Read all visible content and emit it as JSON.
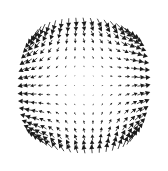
{
  "figure": {
    "title": "",
    "background_color": "#ffffff",
    "width": 168,
    "height": 171
  },
  "chart_data": {
    "type": "scatter",
    "plot_kind": "quiver",
    "title": "",
    "subtitle": "",
    "xlabel": "",
    "ylabel": "",
    "xlim": [
      -1,
      1
    ],
    "ylim": [
      -1,
      1
    ],
    "grid": false,
    "axes_visible": false,
    "tick_labels_x": [],
    "tick_labels_y": [],
    "legend": [],
    "annotations": [],
    "arrow_color": "#1a1a1a",
    "shaft_color": "#2b2b2b",
    "grid_rows": 17,
    "grid_cols": 17,
    "field_description": "radial outward displacement field with pincushion lattice warp and slight clockwise swirl; magnitude increases with distance from center, near zero at center",
    "field_model": {
      "center_x": 0.0,
      "center_y": 0.0,
      "radial_gain": 1.0,
      "swirl_gain": 0.22,
      "magnitude_exponent": 1.25,
      "max_arrow_length_px": 13.5,
      "lattice_pincushion_k": -0.17,
      "plot_margin_px": 9
    },
    "points": [
      {
        "x": -1.0,
        "y": 1.0,
        "u": -0.861,
        "v": 0.509
      },
      {
        "x": -0.875,
        "y": 1.0,
        "u": -0.772,
        "v": 0.636
      },
      {
        "x": -0.75,
        "y": 1.0,
        "u": -0.664,
        "v": 0.748
      },
      {
        "x": -0.625,
        "y": 1.0,
        "u": -0.54,
        "v": 0.841
      },
      {
        "x": -0.5,
        "y": 1.0,
        "u": -0.405,
        "v": 0.914
      },
      {
        "x": -0.375,
        "y": 1.0,
        "u": -0.262,
        "v": 0.965
      },
      {
        "x": -0.25,
        "y": 1.0,
        "u": -0.115,
        "v": 0.993
      },
      {
        "x": -0.125,
        "y": 1.0,
        "u": 0.034,
        "v": 0.999
      },
      {
        "x": 0.0,
        "y": 1.0,
        "u": 0.183,
        "v": 0.983
      },
      {
        "x": 0.125,
        "y": 1.0,
        "u": 0.329,
        "v": 0.944
      },
      {
        "x": 0.25,
        "y": 1.0,
        "u": 0.47,
        "v": 0.883
      },
      {
        "x": 0.375,
        "y": 1.0,
        "u": 0.603,
        "v": 0.798
      },
      {
        "x": 0.5,
        "y": 1.0,
        "u": 0.725,
        "v": 0.689
      },
      {
        "x": 0.625,
        "y": 1.0,
        "u": 0.833,
        "v": 0.553
      },
      {
        "x": 0.75,
        "y": 1.0,
        "u": 0.921,
        "v": 0.39
      },
      {
        "x": 0.875,
        "y": 1.0,
        "u": 0.982,
        "v": 0.2
      },
      {
        "x": 1.0,
        "y": 1.0,
        "u": 1.0,
        "v": 0.0
      },
      {
        "x": -1.0,
        "y": 0.75,
        "u": -0.946,
        "v": 0.324
      },
      {
        "x": -0.75,
        "y": 0.75,
        "u": -0.785,
        "v": 0.619
      },
      {
        "x": -0.5,
        "y": 0.75,
        "u": -0.556,
        "v": 0.831
      },
      {
        "x": -0.25,
        "y": 0.75,
        "u": -0.271,
        "v": 0.963
      },
      {
        "x": 0.0,
        "y": 0.75,
        "u": 0.043,
        "v": 0.999
      },
      {
        "x": 0.25,
        "y": 0.75,
        "u": 0.352,
        "v": 0.936
      },
      {
        "x": 0.5,
        "y": 0.75,
        "u": 0.624,
        "v": 0.781
      },
      {
        "x": 0.75,
        "y": 0.75,
        "u": 0.833,
        "v": 0.553
      },
      {
        "x": 1.0,
        "y": 0.75,
        "u": 0.964,
        "v": 0.266
      },
      {
        "x": -1.0,
        "y": 0.5,
        "u": -0.989,
        "v": 0.149
      },
      {
        "x": -0.75,
        "y": 0.5,
        "u": -0.905,
        "v": 0.425
      },
      {
        "x": -0.5,
        "y": 0.5,
        "u": -0.707,
        "v": 0.707
      },
      {
        "x": -0.25,
        "y": 0.5,
        "u": -0.407,
        "v": 0.913
      },
      {
        "x": 0.0,
        "y": 0.5,
        "u": -0.06,
        "v": 0.998
      },
      {
        "x": 0.25,
        "y": 0.5,
        "u": 0.289,
        "v": 0.957
      },
      {
        "x": 0.5,
        "y": 0.5,
        "u": 0.591,
        "v": 0.807
      },
      {
        "x": 0.75,
        "y": 0.5,
        "u": 0.818,
        "v": 0.575
      },
      {
        "x": 1.0,
        "y": 0.5,
        "u": 0.958,
        "v": 0.287
      },
      {
        "x": -1.0,
        "y": 0.25,
        "u": -0.999,
        "v": -0.043
      },
      {
        "x": -0.75,
        "y": 0.25,
        "u": -0.979,
        "v": 0.204
      },
      {
        "x": -0.5,
        "y": 0.25,
        "u": -0.894,
        "v": 0.447
      },
      {
        "x": -0.25,
        "y": 0.25,
        "u": -0.66,
        "v": 0.751
      },
      {
        "x": 0.0,
        "y": 0.25,
        "u": -0.195,
        "v": 0.981
      },
      {
        "x": 0.25,
        "y": 0.25,
        "u": 0.195,
        "v": 0.981
      },
      {
        "x": 0.5,
        "y": 0.25,
        "u": 0.587,
        "v": 0.81
      },
      {
        "x": 0.75,
        "y": 0.25,
        "u": 0.83,
        "v": 0.558
      },
      {
        "x": 1.0,
        "y": 0.25,
        "u": 0.965,
        "v": 0.262
      },
      {
        "x": -1.0,
        "y": 0.0,
        "u": -0.974,
        "v": -0.225
      },
      {
        "x": -0.75,
        "y": 0.0,
        "u": -0.96,
        "v": -0.28
      },
      {
        "x": -0.5,
        "y": 0.0,
        "u": -0.94,
        "v": -0.342
      },
      {
        "x": -0.25,
        "y": 0.0,
        "u": -0.87,
        "v": -0.493
      },
      {
        "x": 0.0,
        "y": 0.0,
        "u": 0.0,
        "v": 0.0
      },
      {
        "x": 0.25,
        "y": 0.0,
        "u": 0.87,
        "v": 0.493
      },
      {
        "x": 0.5,
        "y": 0.0,
        "u": 0.94,
        "v": 0.342
      },
      {
        "x": 0.75,
        "y": 0.0,
        "u": 0.96,
        "v": 0.28
      },
      {
        "x": 1.0,
        "y": 0.0,
        "u": 0.974,
        "v": 0.225
      },
      {
        "x": -1.0,
        "y": -0.25,
        "u": -0.965,
        "v": -0.262
      },
      {
        "x": -0.75,
        "y": -0.25,
        "u": -0.83,
        "v": -0.558
      },
      {
        "x": -0.5,
        "y": -0.25,
        "u": -0.587,
        "v": -0.81
      },
      {
        "x": -0.25,
        "y": -0.25,
        "u": -0.195,
        "v": -0.981
      },
      {
        "x": 0.0,
        "y": -0.25,
        "u": 0.195,
        "v": -0.981
      },
      {
        "x": 0.25,
        "y": -0.25,
        "u": 0.66,
        "v": -0.751
      },
      {
        "x": 0.5,
        "y": -0.25,
        "u": 0.894,
        "v": -0.447
      },
      {
        "x": 0.75,
        "y": -0.25,
        "u": 0.979,
        "v": -0.204
      },
      {
        "x": 1.0,
        "y": -0.25,
        "u": 0.999,
        "v": 0.043
      },
      {
        "x": -1.0,
        "y": -0.5,
        "u": -0.958,
        "v": -0.287
      },
      {
        "x": -0.75,
        "y": -0.5,
        "u": -0.818,
        "v": -0.575
      },
      {
        "x": -0.5,
        "y": -0.5,
        "u": -0.591,
        "v": -0.807
      },
      {
        "x": -0.25,
        "y": -0.5,
        "u": -0.289,
        "v": -0.957
      },
      {
        "x": 0.0,
        "y": -0.5,
        "u": 0.06,
        "v": -0.998
      },
      {
        "x": 0.25,
        "y": -0.5,
        "u": 0.407,
        "v": -0.913
      },
      {
        "x": 0.5,
        "y": -0.5,
        "u": 0.707,
        "v": -0.707
      },
      {
        "x": 0.75,
        "y": -0.5,
        "u": 0.905,
        "v": -0.425
      },
      {
        "x": 1.0,
        "y": -0.5,
        "u": 0.989,
        "v": -0.149
      },
      {
        "x": -1.0,
        "y": -0.75,
        "u": -0.964,
        "v": -0.266
      },
      {
        "x": -0.75,
        "y": -0.75,
        "u": -0.833,
        "v": -0.553
      },
      {
        "x": -0.5,
        "y": -0.75,
        "u": -0.624,
        "v": -0.781
      },
      {
        "x": -0.25,
        "y": -0.75,
        "u": -0.352,
        "v": -0.936
      },
      {
        "x": 0.0,
        "y": -0.75,
        "u": -0.043,
        "v": -0.999
      },
      {
        "x": 0.25,
        "y": -0.75,
        "u": 0.271,
        "v": -0.963
      },
      {
        "x": 0.5,
        "y": -0.75,
        "u": 0.556,
        "v": -0.831
      },
      {
        "x": 0.75,
        "y": -0.75,
        "u": 0.785,
        "v": -0.619
      },
      {
        "x": 1.0,
        "y": -0.75,
        "u": 0.946,
        "v": -0.324
      },
      {
        "x": -1.0,
        "y": -1.0,
        "u": -1.0,
        "v": 0.0
      },
      {
        "x": -0.875,
        "y": -1.0,
        "u": -0.982,
        "v": -0.2
      },
      {
        "x": -0.75,
        "y": -1.0,
        "u": -0.921,
        "v": -0.39
      },
      {
        "x": -0.625,
        "y": -1.0,
        "u": -0.833,
        "v": -0.553
      },
      {
        "x": -0.5,
        "y": -1.0,
        "u": -0.725,
        "v": -0.689
      },
      {
        "x": -0.375,
        "y": -1.0,
        "u": -0.603,
        "v": -0.798
      },
      {
        "x": -0.25,
        "y": -1.0,
        "u": -0.47,
        "v": -0.883
      },
      {
        "x": -0.125,
        "y": -1.0,
        "u": -0.329,
        "v": -0.944
      },
      {
        "x": 0.0,
        "y": -1.0,
        "u": -0.183,
        "v": -0.983
      },
      {
        "x": 0.125,
        "y": -1.0,
        "u": -0.034,
        "v": -0.999
      },
      {
        "x": 0.25,
        "y": -1.0,
        "u": 0.115,
        "v": -0.993
      },
      {
        "x": 0.375,
        "y": -1.0,
        "u": 0.262,
        "v": -0.965
      },
      {
        "x": 0.5,
        "y": -1.0,
        "u": 0.405,
        "v": -0.914
      },
      {
        "x": 0.625,
        "y": -1.0,
        "u": 0.54,
        "v": -0.841
      },
      {
        "x": 0.75,
        "y": -1.0,
        "u": 0.664,
        "v": -0.748
      },
      {
        "x": 0.875,
        "y": -1.0,
        "u": 0.772,
        "v": -0.636
      },
      {
        "x": 1.0,
        "y": -1.0,
        "u": 0.861,
        "v": -0.509
      }
    ]
  }
}
